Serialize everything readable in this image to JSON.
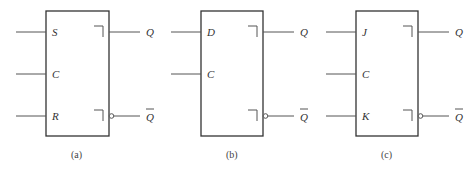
{
  "diagrams": [
    {
      "caption": "(a)",
      "inputs": [
        "S",
        "C",
        "R"
      ],
      "outputs": [
        "Q",
        "Q"
      ],
      "output_complemented": [
        false,
        true
      ]
    },
    {
      "caption": "(b)",
      "inputs": [
        "D",
        "C"
      ],
      "outputs": [
        "Q",
        "Q"
      ],
      "output_complemented": [
        false,
        true
      ]
    },
    {
      "caption": "(c)",
      "inputs": [
        "J",
        "C",
        "K"
      ],
      "outputs": [
        "Q",
        "Q"
      ],
      "output_complemented": [
        false,
        true
      ]
    }
  ]
}
